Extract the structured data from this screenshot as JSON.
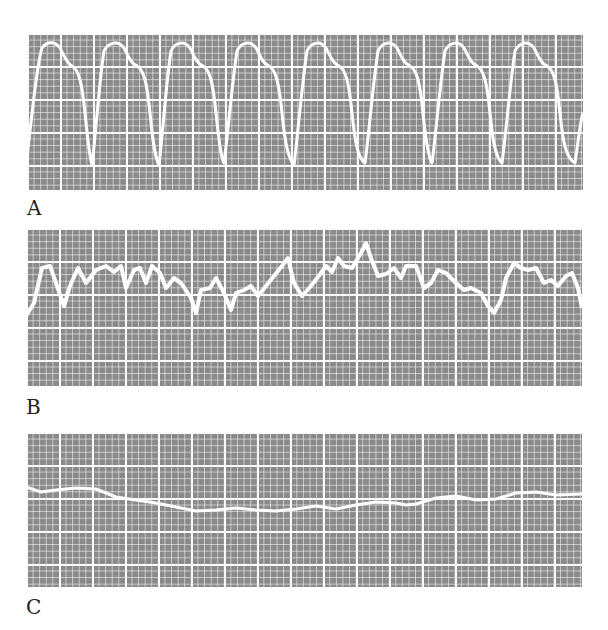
{
  "panels": [
    {
      "label": "A",
      "trace": "arterial pressure waveform, regular pulsatile beats",
      "beats": 8
    },
    {
      "label": "B",
      "trace": "irregular fluctuating waveform"
    },
    {
      "label": "C",
      "trace": "nearly flat, slowly undulating waveform"
    }
  ],
  "colors": {
    "grid_background": "#8a8a8a",
    "grid_lines": "#ffffff",
    "trace": "#ffffff"
  }
}
